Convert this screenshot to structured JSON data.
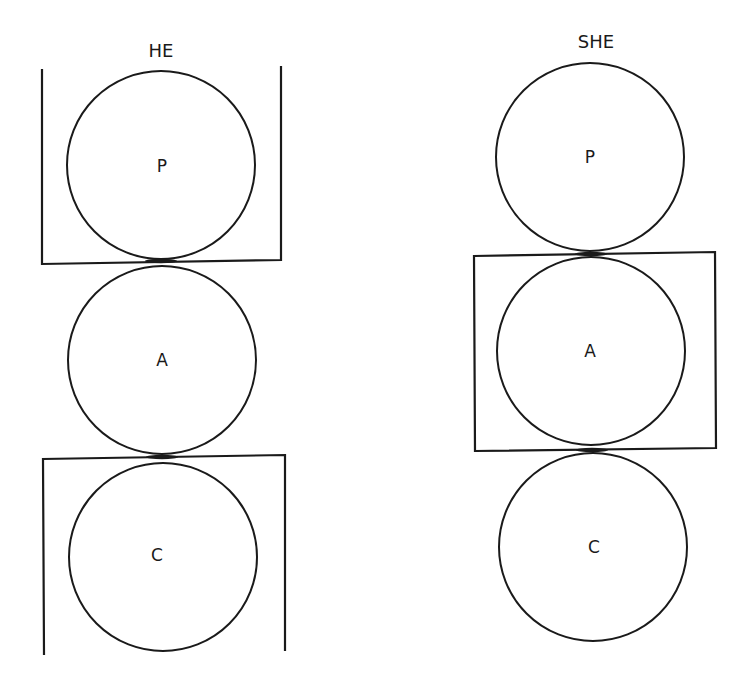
{
  "figures": [
    {
      "id": "he",
      "title": "HE",
      "circles": [
        {
          "label": "P"
        },
        {
          "label": "A"
        },
        {
          "label": "C"
        }
      ],
      "enclosed": [
        "P",
        "C"
      ],
      "enclosure_style": "open-brackets"
    },
    {
      "id": "she",
      "title": "SHE",
      "circles": [
        {
          "label": "P"
        },
        {
          "label": "A"
        },
        {
          "label": "C"
        }
      ],
      "enclosed": [
        "A"
      ],
      "enclosure_style": "closed-box"
    }
  ],
  "colors": {
    "ink": "#1a1a1a",
    "background": "#ffffff"
  }
}
